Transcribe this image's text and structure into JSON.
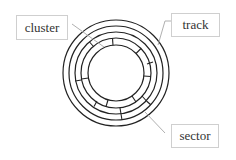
{
  "diagram": {
    "type": "disk-structure",
    "labels": {
      "cluster": "cluster",
      "track": "track",
      "sector": "sector"
    },
    "colors": {
      "stroke": "#222222",
      "pointer": "#b0b0b0",
      "box_border": "#cfcfcf"
    },
    "concentric_circles": 5
  }
}
